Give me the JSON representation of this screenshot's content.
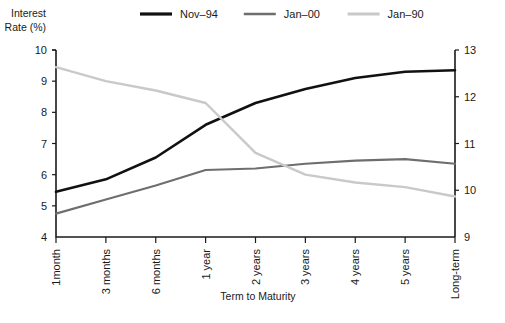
{
  "chart_data": {
    "type": "line",
    "title": "",
    "xlabel": "Term to Maturity",
    "ylabel": "Interest\nRate (%)",
    "ylabel_line1": "Interest",
    "ylabel_line2": "Rate (%)",
    "y2label": "",
    "categories": [
      "1month",
      "3 months",
      "6 months",
      "1 year",
      "2 years",
      "3 years",
      "4 years",
      "5 years",
      "Long-term"
    ],
    "ylim": [
      4,
      10
    ],
    "yticks": [
      4,
      5,
      6,
      7,
      8,
      9,
      10
    ],
    "y2lim": [
      9,
      13
    ],
    "y2ticks": [
      9,
      10,
      11,
      12,
      13
    ],
    "grid": false,
    "legend_position": "top",
    "series": [
      {
        "name": "Nov–94",
        "color": "#111111",
        "axis": "left",
        "width": 2.6,
        "values": [
          5.45,
          5.85,
          6.55,
          7.6,
          8.3,
          8.75,
          9.1,
          9.3,
          9.35
        ]
      },
      {
        "name": "Jan–00",
        "color": "#6e6e6e",
        "axis": "left",
        "width": 2.1,
        "values": [
          4.75,
          5.2,
          5.65,
          6.15,
          6.2,
          6.35,
          6.45,
          6.5,
          6.35
        ]
      },
      {
        "name": "Jan–90",
        "color": "#c9c9c9",
        "axis": "left",
        "width": 2.4,
        "values": [
          9.45,
          9.0,
          8.7,
          8.3,
          6.7,
          6.0,
          5.75,
          5.6,
          5.3
        ]
      }
    ]
  },
  "legend": {
    "items": [
      {
        "label": "Nov–94",
        "color": "#111111"
      },
      {
        "label": "Jan–00",
        "color": "#6e6e6e"
      },
      {
        "label": "Jan–90",
        "color": "#c9c9c9"
      }
    ]
  },
  "axes": {
    "left_title_line1": "Interest",
    "left_title_line2": "Rate (%)",
    "bottom_title": "Term to Maturity"
  }
}
